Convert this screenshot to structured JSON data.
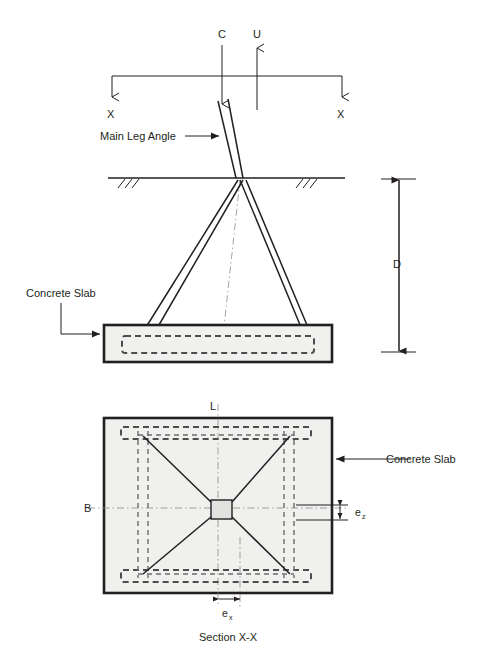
{
  "figure": {
    "caption": "Section X-X",
    "elevation": {
      "load_compression": "C",
      "load_uplift": "U",
      "section_mark_left": "X",
      "section_mark_right": "X",
      "leg_label": "Main Leg Angle",
      "slab_label": "Concrete Slab",
      "depth_label": "D"
    },
    "plan": {
      "length_label": "L",
      "width_label": "B",
      "slab_label": "Concrete Slab",
      "ecc_z_label": "e",
      "ecc_z_sub": "z",
      "ecc_x_label": "e",
      "ecc_x_sub": "x"
    }
  },
  "colors": {
    "ink": "#231f20",
    "slab_fill": "#f0f0ee",
    "rebar": "#4d4d4d",
    "centerline": "#8c8c8c"
  }
}
